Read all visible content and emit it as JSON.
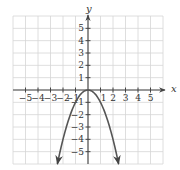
{
  "chart_data": {
    "type": "line",
    "title": "",
    "xlabel": "x",
    "ylabel": "y",
    "xlim": [
      -6,
      6
    ],
    "ylim": [
      -6,
      6
    ],
    "grid": true,
    "x_ticks": [
      -5,
      -4,
      -3,
      -2,
      -1,
      1,
      2,
      3,
      4,
      5
    ],
    "y_ticks": [
      -5,
      -4,
      -3,
      -2,
      -1,
      1,
      2,
      3,
      4,
      5
    ],
    "x_tick_labels": [
      "−5",
      "−4",
      "−3",
      "−2",
      "−1",
      "1",
      "2",
      "3",
      "4",
      "5"
    ],
    "y_tick_labels": [
      "−5",
      "−4",
      "−3",
      "−2",
      "−1",
      "1",
      "2",
      "3",
      "4",
      "5"
    ],
    "series": [
      {
        "name": "y = -x^2",
        "equation": "y = -x^2",
        "x": [
          -2.45,
          -2,
          -1.5,
          -1,
          -0.5,
          0,
          0.5,
          1,
          1.5,
          2,
          2.45
        ],
        "y": [
          -6,
          -4,
          -2.25,
          -1,
          -0.25,
          0,
          -0.25,
          -1,
          -2.25,
          -4,
          -6
        ],
        "arrows_at_ends": true,
        "vertex": [
          0,
          0
        ]
      }
    ]
  },
  "axes": {
    "x_label": "x",
    "y_label": "y"
  },
  "colors": {
    "curve": "#555555",
    "axis": "#444444",
    "grid": "#d6d6d6"
  }
}
